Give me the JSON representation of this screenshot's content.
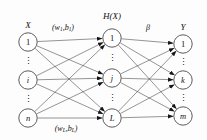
{
  "figure": {
    "background_color": "#fdfdfd",
    "node_stroke_color": "#4a4a4a",
    "edge_color": "#3d3d3d",
    "text_color": "#101010",
    "width": 207,
    "height": 140
  },
  "layers": {
    "input": {
      "title": "X",
      "nodes": [
        {
          "label": "1",
          "cx": 28,
          "cy": 42,
          "r": 9.2,
          "italic": false
        },
        {
          "label": "i",
          "cx": 28,
          "cy": 80,
          "r": 9.2,
          "italic": true
        },
        {
          "label": "n",
          "cx": 28,
          "cy": 118,
          "r": 9.2,
          "italic": true
        }
      ],
      "ellipses": [
        {
          "cx": 28,
          "cy": 61
        },
        {
          "cx": 28,
          "cy": 99
        }
      ],
      "title_x": 28,
      "title_y": 25
    },
    "hidden": {
      "title": "H(X)",
      "nodes": [
        {
          "label": "1",
          "cx": 112,
          "cy": 38,
          "r": 9.2,
          "italic": false
        },
        {
          "label": "j",
          "cx": 112,
          "cy": 78,
          "r": 9.2,
          "italic": true
        },
        {
          "label": "L",
          "cx": 112,
          "cy": 118,
          "r": 9.2,
          "italic": true
        }
      ],
      "ellipses": [
        {
          "cx": 112,
          "cy": 58
        },
        {
          "cx": 112,
          "cy": 98
        }
      ],
      "title_x": 112,
      "title_y": 16
    },
    "output": {
      "title": "Y",
      "nodes": [
        {
          "label": "1",
          "cx": 183,
          "cy": 44,
          "r": 9.2,
          "italic": false
        },
        {
          "label": "k",
          "cx": 183,
          "cy": 80,
          "r": 9.2,
          "italic": true
        },
        {
          "label": "m",
          "cx": 183,
          "cy": 116,
          "r": 9.2,
          "italic": true
        }
      ],
      "ellipses": [
        {
          "cx": 183,
          "cy": 62
        },
        {
          "cx": 183,
          "cy": 98
        }
      ],
      "title_x": 183,
      "title_y": 27
    }
  },
  "annotations": [
    {
      "name": "input-hidden-weight-first",
      "base": "(w",
      "sub1": "1",
      "mid": ",b",
      "sub2": "1",
      "close": ")",
      "x": 63,
      "y": 27
    },
    {
      "name": "input-hidden-weight-last",
      "base": "(w",
      "sub1": "L",
      "mid": ",b",
      "sub2": "L",
      "close": ")",
      "x": 66,
      "y": 128
    },
    {
      "name": "hidden-output-weight-beta",
      "base": "β",
      "sub1": "",
      "mid": "",
      "sub2": "",
      "close": "",
      "x": 148,
      "y": 27
    }
  ],
  "ellipsis_glyph": "⋮",
  "edges": {
    "input_to_hidden_count": 9,
    "hidden_to_output_count": 9,
    "arrowheads": "filled-triangle-at-target"
  }
}
